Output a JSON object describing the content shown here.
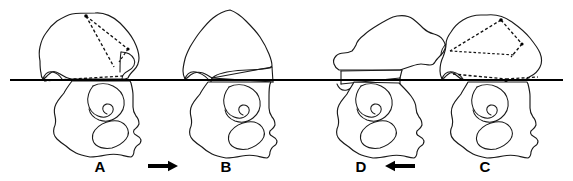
{
  "figure": {
    "type": "anatomical-line-diagram",
    "title": "",
    "background_color": "#ffffff",
    "line_color": "#1a1a1a",
    "width": 573,
    "height": 181,
    "reference_line": {
      "name": "horizontal-reference-line",
      "orientation": "horizontal",
      "x_start": 10,
      "x_end": 563,
      "y": 80,
      "color": "#000000",
      "thickness": 2.1
    },
    "panels": [
      {
        "id": "panel-a",
        "label": "A",
        "label_x": 100,
        "label_y": 172,
        "has_dashed_overlay": true,
        "dashed_overlay_description": "dashed triangulation lines across upper bone fragment and along reference line"
      },
      {
        "id": "panel-b",
        "label": "B",
        "label_x": 226,
        "label_y": 172,
        "has_dashed_overlay": false,
        "dashed_overlay_description": ""
      },
      {
        "id": "panel-d",
        "label": "D",
        "label_x": 361,
        "label_y": 172,
        "has_dashed_overlay": false,
        "dashed_overlay_description": ""
      },
      {
        "id": "panel-c",
        "label": "C",
        "label_x": 485,
        "label_y": 172,
        "has_dashed_overlay": true,
        "dashed_overlay_description": "dashed triangulation lines across upper bone fragment and along reference line"
      }
    ],
    "arrows": [
      {
        "id": "arrow-a-to-b",
        "direction": "right",
        "glyph": "right-arrow",
        "x_center": 163,
        "y_center": 166,
        "length": 30,
        "color": "#000000"
      },
      {
        "id": "arrow-c-to-d",
        "direction": "left",
        "glyph": "left-arrow",
        "x_center": 400,
        "y_center": 166,
        "length": 30,
        "color": "#000000"
      }
    ]
  }
}
